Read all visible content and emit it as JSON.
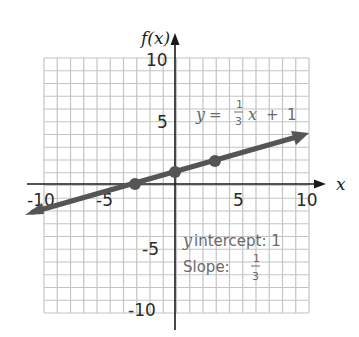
{
  "chart_data": {
    "type": "line",
    "title": "",
    "xlabel": "x",
    "ylabel": "f(x)",
    "xlim": [
      -10,
      10
    ],
    "ylim": [
      -10,
      10
    ],
    "grid": true,
    "x_ticks": [
      "-10",
      "-5",
      "5",
      "10"
    ],
    "y_ticks": [
      "10",
      "5",
      "-5",
      "-10"
    ],
    "series": [
      {
        "name": "y = 1/3 x + 1",
        "slope": "1/3",
        "intercept": 1,
        "x": [
          -10,
          -3,
          0,
          3,
          10
        ],
        "y": [
          -2.33,
          0,
          1,
          2,
          4.33
        ],
        "marked_points": [
          [
            -3,
            0
          ],
          [
            0,
            1
          ],
          [
            3,
            2
          ]
        ],
        "color": "#555555"
      }
    ],
    "annotations": {
      "equation": {
        "lhs": "y",
        "eq": "=",
        "num": "1",
        "den": "3",
        "var": "x",
        "plus": "+",
        "const": "1"
      },
      "intercept_label": "y intercept: 1",
      "intercept_var": "y",
      "intercept_text": "intercept: 1",
      "slope_label": "Slope:",
      "slope_num": "1",
      "slope_den": "3"
    },
    "legend": "none"
  },
  "colors": {
    "grid": "#c4c4c4",
    "axis": "#1a1a1a",
    "line": "#555555",
    "annotation": "#6a6a6a"
  }
}
